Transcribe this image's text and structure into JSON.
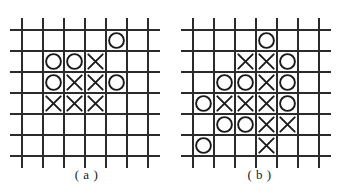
{
  "figure": {
    "background_color": "#ffffff",
    "line_color": "#2b2b2b",
    "symbol_color": "#1a1a1a",
    "grid": {
      "vertical_lines": 7,
      "horizontal_lines": 7,
      "cell_size": 21,
      "line_width": 2
    }
  },
  "panels": [
    {
      "id": "a",
      "caption": "( a )",
      "origin_x": 22,
      "origin_y": 30,
      "line_extend": 12,
      "stones": [
        {
          "symbol": "O",
          "col": 4,
          "row": 1
        },
        {
          "symbol": "O",
          "col": 1,
          "row": 2
        },
        {
          "symbol": "O",
          "col": 2,
          "row": 2
        },
        {
          "symbol": "X",
          "col": 3,
          "row": 2
        },
        {
          "symbol": "O",
          "col": 1,
          "row": 3
        },
        {
          "symbol": "X",
          "col": 2,
          "row": 3
        },
        {
          "symbol": "X",
          "col": 3,
          "row": 3
        },
        {
          "symbol": "O",
          "col": 4,
          "row": 3
        },
        {
          "symbol": "X",
          "col": 1,
          "row": 4
        },
        {
          "symbol": "X",
          "col": 2,
          "row": 4
        },
        {
          "symbol": "X",
          "col": 3,
          "row": 4
        }
      ]
    },
    {
      "id": "b",
      "caption": "( b )",
      "origin_x": 20,
      "origin_y": 30,
      "line_extend": 12,
      "stones": [
        {
          "symbol": "O",
          "col": 3,
          "row": 1
        },
        {
          "symbol": "X",
          "col": 2,
          "row": 2
        },
        {
          "symbol": "X",
          "col": 3,
          "row": 2
        },
        {
          "symbol": "O",
          "col": 4,
          "row": 2
        },
        {
          "symbol": "O",
          "col": 1,
          "row": 3
        },
        {
          "symbol": "O",
          "col": 2,
          "row": 3
        },
        {
          "symbol": "X",
          "col": 3,
          "row": 3
        },
        {
          "symbol": "O",
          "col": 4,
          "row": 3
        },
        {
          "symbol": "O",
          "col": 0,
          "row": 4
        },
        {
          "symbol": "X",
          "col": 1,
          "row": 4
        },
        {
          "symbol": "X",
          "col": 2,
          "row": 4
        },
        {
          "symbol": "X",
          "col": 3,
          "row": 4
        },
        {
          "symbol": "O",
          "col": 4,
          "row": 4
        },
        {
          "symbol": "O",
          "col": 1,
          "row": 5
        },
        {
          "symbol": "O",
          "col": 2,
          "row": 5
        },
        {
          "symbol": "X",
          "col": 3,
          "row": 5
        },
        {
          "symbol": "X",
          "col": 4,
          "row": 5
        },
        {
          "symbol": "O",
          "col": 0,
          "row": 6
        },
        {
          "symbol": "X",
          "col": 3,
          "row": 6
        }
      ]
    }
  ]
}
